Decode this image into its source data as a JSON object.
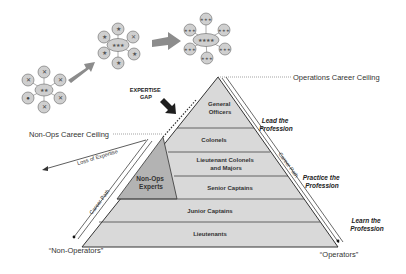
{
  "diagram": {
    "colors": {
      "pyramid_fill": "#d9d9d9",
      "nonops_fill": "#b3b3b3",
      "line": "#333333",
      "arrow_gray": "#8c8c8c",
      "arrow_dark": "#222222",
      "node_fill": "#cfcfcf"
    },
    "levels": [
      {
        "label_1": "General",
        "label_2": "Officers"
      },
      {
        "label_1": "Colonels"
      },
      {
        "label_1": "Lieutenant Colonels",
        "label_2": "and Majors"
      },
      {
        "label_1": "Senior Captains"
      },
      {
        "label_1": "Junior Captains"
      },
      {
        "label_1": "Lieutenants"
      }
    ],
    "non_ops_experts": {
      "label_1": "Non-Ops",
      "label_2": "Experts"
    },
    "expertise_gap": {
      "label_1": "EXPERTISE",
      "label_2": "GAP"
    },
    "ceilings": {
      "operations": "Operations Career Ceiling",
      "non_ops": "Non-Ops Career Ceiling"
    },
    "career_path_left": "Career Path",
    "career_path_right": "Career Path",
    "loss_of_expertise": "Loss of Expertise",
    "side_labels": [
      {
        "line_1": "Lead the",
        "line_2": "Profession"
      },
      {
        "line_1": "Practice the",
        "line_2": "Profession"
      },
      {
        "line_1": "Learn the",
        "line_2": "Profession"
      }
    ],
    "endpoints": {
      "non_operators": "“Non-Operators”",
      "operators": "“Operators”"
    },
    "org_clusters": [
      {
        "center_rank": "two-star",
        "satellite_icon": "eagle-icon"
      },
      {
        "center_rank": "three-star",
        "satellite_icon": "one-star-icon"
      },
      {
        "center_rank": "four-star",
        "satellite_icon": "three-star-icon"
      }
    ]
  }
}
